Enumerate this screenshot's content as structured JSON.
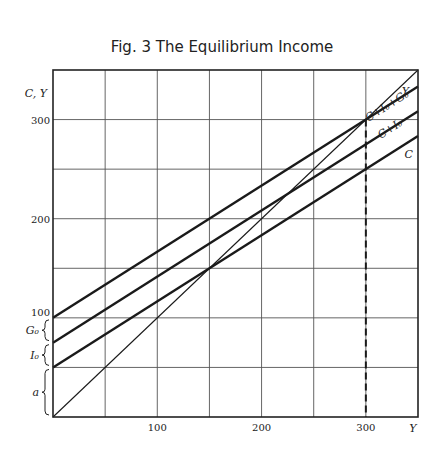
{
  "chart_data": {
    "type": "line",
    "title": "Fig. 3 The Equilibrium Income",
    "xlabel": "Y",
    "ylabel": "C, Y",
    "xlim": [
      0,
      350
    ],
    "ylim": [
      0,
      350
    ],
    "grid": true,
    "x_ticks": [
      100,
      200,
      300
    ],
    "x_tick_labels": [
      "100",
      "200",
      "300"
    ],
    "y_ticks": [
      100,
      200,
      300
    ],
    "y_tick_labels": [
      "100",
      "200",
      "300"
    ],
    "grid_step": 50,
    "series": [
      {
        "name": "Y",
        "label": "Y",
        "intercept": 0,
        "slope": 1,
        "weight": "thin"
      },
      {
        "name": "C+I0+G0",
        "label": "C+I₀+G₀",
        "intercept": 100,
        "slope": 0.6667,
        "weight": "bold"
      },
      {
        "name": "C+I0",
        "label": "C+I₀",
        "intercept": 75,
        "slope": 0.6667,
        "weight": "bold"
      },
      {
        "name": "C",
        "label": "C",
        "intercept": 50,
        "slope": 0.6667,
        "weight": "bold"
      }
    ],
    "equilibrium": {
      "x": 300,
      "y": 300,
      "dashed_drop_to_axis": true
    },
    "brace_annotations": [
      {
        "label": "a",
        "from": 0,
        "to": 50
      },
      {
        "label": "I₀",
        "from": 50,
        "to": 75
      },
      {
        "label": "G₀",
        "from": 75,
        "to": 100
      }
    ]
  }
}
